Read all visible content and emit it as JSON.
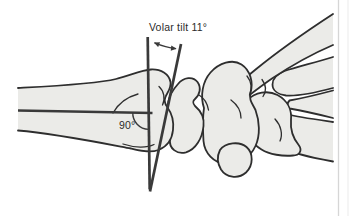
{
  "figure": {
    "description_labels": {
      "volar_tilt": "Volar tilt 11°",
      "right_angle": "90°"
    },
    "colors": {
      "background": "#ffffff",
      "bone_fill": "#ebebe8",
      "bone_outline": "#2e2e2e",
      "measurement": "#3a3a3a",
      "label_text": "#2b2b2b",
      "page_edge": "#d6d6d6"
    }
  }
}
